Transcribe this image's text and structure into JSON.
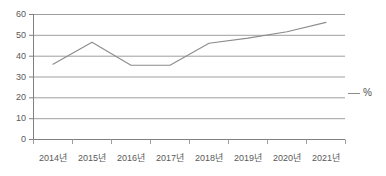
{
  "chart_data": {
    "type": "line",
    "title": "",
    "xlabel": "",
    "ylabel": "",
    "categories": [
      "2014년",
      "2015년",
      "2016년",
      "2017년",
      "2018년",
      "2019년",
      "2020년",
      "2021년"
    ],
    "series": [
      {
        "name": "%",
        "values": [
          36,
          46.5,
          35.5,
          35.5,
          46,
          48.5,
          51.5,
          56
        ]
      }
    ],
    "ylim": [
      0,
      60
    ],
    "yticks": [
      0,
      10,
      20,
      30,
      40,
      50,
      60
    ],
    "ytick_labels": [
      "0",
      "10",
      "20",
      "30",
      "40",
      "50",
      "60"
    ],
    "grid": true,
    "grid_axis": "y",
    "legend": {
      "position": "right",
      "entries": [
        {
          "label": "%",
          "marker": "line",
          "color": "#8c8c8c"
        }
      ]
    },
    "colors": {
      "line": "#8c8c8c",
      "grid": "#9e9e9e",
      "axis": "#808080",
      "text": "#595959",
      "background": "#ffffff"
    }
  },
  "legend": {
    "percent_label": "%"
  }
}
